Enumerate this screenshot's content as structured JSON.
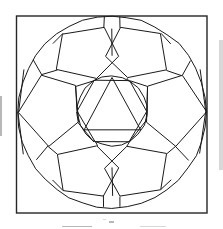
{
  "document": {
    "kind": "line-drawing",
    "title": "Soccer ball polyhedral net diagram",
    "background_color": "#ffffff",
    "ink_color": "#1a1a1a",
    "frame_color": "#262626",
    "width": 223,
    "height": 229,
    "text_labels": []
  },
  "figure": {
    "name": "soccer-ball-diagram",
    "frame": {
      "x": 16.5,
      "y": 16.0,
      "width": 190.5,
      "height": 197.0
    },
    "outer_circle": {
      "cx": 112,
      "cy": 112,
      "rx": 94,
      "ry": 96,
      "sides": 40
    },
    "inner_circle": {
      "cx": 112,
      "cy": 111,
      "rx": 35,
      "ry": 35,
      "sides": 22
    },
    "hexagon": {
      "cx": 112,
      "cy": 111,
      "r": 35,
      "rotation_deg": 0,
      "vertices": [
        [
          147,
          111
        ],
        [
          129.5,
          141.3
        ],
        [
          94.5,
          141.3
        ],
        [
          77,
          111
        ],
        [
          94.5,
          80.7
        ],
        [
          129.5,
          80.7
        ]
      ]
    },
    "triangle": {
      "cx": 112,
      "cy": 111,
      "vertices": [
        [
          112,
          78
        ],
        [
          140,
          130
        ],
        [
          84,
          130
        ]
      ]
    },
    "pentagons": [
      {
        "id": "pentagon-top-left",
        "vertices": [
          [
            57,
            70
          ],
          [
            63,
            34
          ],
          [
            104,
            28
          ],
          [
            119,
            56
          ],
          [
            97,
            78
          ]
        ]
      },
      {
        "id": "pentagon-top-right",
        "vertices": [
          [
            167,
            70
          ],
          [
            161,
            34
          ],
          [
            120,
            28
          ],
          [
            105,
            56
          ],
          [
            127,
            78
          ]
        ]
      },
      {
        "id": "pentagon-left",
        "vertices": [
          [
            18,
            112
          ],
          [
            42,
            75
          ],
          [
            76,
            86
          ],
          [
            78,
            122
          ],
          [
            48,
            146
          ]
        ]
      },
      {
        "id": "pentagon-right",
        "vertices": [
          [
            206,
            112
          ],
          [
            182,
            75
          ],
          [
            148,
            86
          ],
          [
            146,
            122
          ],
          [
            176,
            146
          ]
        ]
      },
      {
        "id": "pentagon-bottom-left",
        "vertices": [
          [
            57,
            154
          ],
          [
            63,
            190
          ],
          [
            104,
            196
          ],
          [
            119,
            168
          ],
          [
            97,
            146
          ]
        ]
      },
      {
        "id": "pentagon-bottom-right",
        "vertices": [
          [
            167,
            154
          ],
          [
            161,
            190
          ],
          [
            120,
            196
          ],
          [
            105,
            168
          ],
          [
            127,
            146
          ]
        ]
      }
    ],
    "seam_lines": [
      {
        "id": "seam-top-center",
        "from": [
          112,
          28
        ],
        "to": [
          112,
          56
        ]
      },
      {
        "id": "seam-bottom-center",
        "from": [
          112,
          196
        ],
        "to": [
          112,
          168
        ]
      },
      {
        "id": "seam-upper-left-spoke",
        "from": [
          57,
          70
        ],
        "to": [
          42,
          75
        ]
      },
      {
        "id": "seam-upper-right-spoke",
        "from": [
          167,
          70
        ],
        "to": [
          182,
          75
        ]
      },
      {
        "id": "seam-lower-left-spoke",
        "from": [
          57,
          154
        ],
        "to": [
          48,
          146
        ]
      },
      {
        "id": "seam-lower-right-spoke",
        "from": [
          167,
          154
        ],
        "to": [
          176,
          146
        ]
      },
      {
        "id": "seam-left-outer-upper",
        "from": [
          18,
          112
        ],
        "to": [
          24,
          70
        ]
      },
      {
        "id": "seam-left-outer-lower",
        "from": [
          18,
          112
        ],
        "to": [
          24,
          154
        ]
      },
      {
        "id": "seam-right-outer-upper",
        "from": [
          206,
          112
        ],
        "to": [
          200,
          70
        ]
      },
      {
        "id": "seam-right-outer-lower",
        "from": [
          206,
          112
        ],
        "to": [
          200,
          154
        ]
      },
      {
        "id": "seam-tl-to-hex",
        "from": [
          97,
          78
        ],
        "to": [
          94.5,
          80.7
        ]
      },
      {
        "id": "seam-tr-to-hex",
        "from": [
          127,
          78
        ],
        "to": [
          129.5,
          80.7
        ]
      },
      {
        "id": "seam-bl-to-hex",
        "from": [
          97,
          146
        ],
        "to": [
          94.5,
          141.3
        ]
      },
      {
        "id": "seam-br-to-hex",
        "from": [
          127,
          146
        ],
        "to": [
          129.5,
          141.3
        ]
      },
      {
        "id": "seam-l-to-hex-top",
        "from": [
          76,
          86
        ],
        "to": [
          94.5,
          80.7
        ]
      },
      {
        "id": "seam-l-to-hex-bottom",
        "from": [
          78,
          122
        ],
        "to": [
          94.5,
          141.3
        ]
      },
      {
        "id": "seam-r-to-hex-top",
        "from": [
          148,
          86
        ],
        "to": [
          129.5,
          80.7
        ]
      },
      {
        "id": "seam-r-to-hex-bottom",
        "from": [
          146,
          122
        ],
        "to": [
          129.5,
          141.3
        ]
      },
      {
        "id": "seam-left-hex-edge",
        "from": [
          76,
          86
        ],
        "to": [
          77,
          111
        ]
      },
      {
        "id": "seam-left-hex-edge-2",
        "from": [
          78,
          122
        ],
        "to": [
          77,
          111
        ]
      },
      {
        "id": "seam-right-hex-edge",
        "from": [
          148,
          86
        ],
        "to": [
          147,
          111
        ]
      },
      {
        "id": "seam-right-hex-edge-2",
        "from": [
          146,
          122
        ],
        "to": [
          147,
          111
        ]
      },
      {
        "id": "seam-tl-rim-a",
        "from": [
          63,
          34
        ],
        "to": [
          53,
          44
        ]
      },
      {
        "id": "seam-tr-rim-a",
        "from": [
          161,
          34
        ],
        "to": [
          171,
          44
        ]
      },
      {
        "id": "seam-bl-rim-a",
        "from": [
          63,
          190
        ],
        "to": [
          53,
          180
        ]
      },
      {
        "id": "seam-br-rim-a",
        "from": [
          161,
          190
        ],
        "to": [
          171,
          180
        ]
      },
      {
        "id": "seam-tl-rim-b",
        "from": [
          104,
          28
        ],
        "to": [
          104,
          17
        ]
      },
      {
        "id": "seam-tr-rim-b",
        "from": [
          120,
          28
        ],
        "to": [
          120,
          17
        ]
      },
      {
        "id": "seam-bl-rim-b",
        "from": [
          104,
          196
        ],
        "to": [
          104,
          207
        ]
      },
      {
        "id": "seam-br-rim-b",
        "from": [
          120,
          196
        ],
        "to": [
          120,
          207
        ]
      },
      {
        "id": "seam-left-pent-rim-top",
        "from": [
          42,
          75
        ],
        "to": [
          33,
          60
        ]
      },
      {
        "id": "seam-left-pent-rim-bot",
        "from": [
          48,
          146
        ],
        "to": [
          36,
          160
        ]
      },
      {
        "id": "seam-right-pent-rim-top",
        "from": [
          182,
          75
        ],
        "to": [
          191,
          60
        ]
      },
      {
        "id": "seam-right-pent-rim-bot",
        "from": [
          176,
          146
        ],
        "to": [
          188,
          160
        ]
      }
    ]
  },
  "scan_artifacts": {
    "description": "Faint grey specks and edge grain from a low-quality scan",
    "specks": [
      {
        "x": 109,
        "y": 221,
        "w": 5,
        "h": 2
      },
      {
        "x": 103,
        "y": 219,
        "w": 3,
        "h": 1
      },
      {
        "x": 0,
        "y": 96,
        "w": 2,
        "h": 40
      },
      {
        "x": 219,
        "y": 40,
        "w": 4,
        "h": 130
      },
      {
        "x": 62,
        "y": 226,
        "w": 30,
        "h": 1
      },
      {
        "x": 140,
        "y": 226,
        "w": 26,
        "h": 1
      }
    ]
  }
}
